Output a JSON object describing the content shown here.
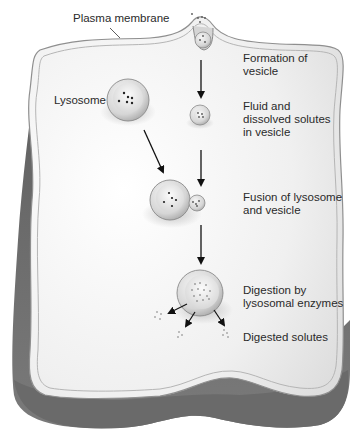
{
  "diagram": {
    "labels": {
      "plasma_membrane": "Plasma membrane",
      "lysosome": "Lysosome",
      "formation": "Formation of\nvesicle",
      "fluid": "Fluid and\ndissolved solutes\nin vesicle",
      "fusion": "Fusion of lysosome\nand vesicle",
      "digestion": "Digestion by\nlysosomal enzymes",
      "digested": "Digested solutes"
    },
    "colors": {
      "cell_top": "#f2f2f2",
      "cell_side": "#6e6e6e",
      "membrane_line": "#9a9a9a",
      "arrow": "#111111",
      "text": "#2a2a2a"
    },
    "steps": [
      "Formation of vesicle",
      "Fluid and dissolved solutes in vesicle",
      "Fusion of lysosome and vesicle",
      "Digestion by lysosomal enzymes",
      "Digested solutes"
    ]
  }
}
